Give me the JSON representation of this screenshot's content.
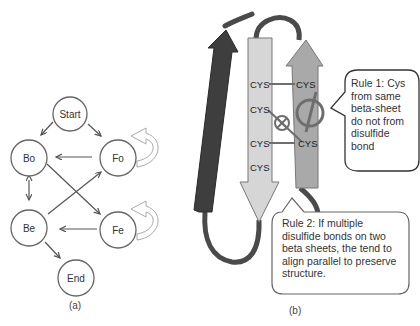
{
  "panel_a": {
    "caption": "(a)",
    "nodes": [
      {
        "id": "start",
        "label": "Start"
      },
      {
        "id": "bo",
        "label": "Bo"
      },
      {
        "id": "fo",
        "label": "Fo"
      },
      {
        "id": "be",
        "label": "Be"
      },
      {
        "id": "fe",
        "label": "Fe"
      },
      {
        "id": "end",
        "label": "End"
      }
    ],
    "edges": [
      {
        "from": "Start",
        "to": "Bo"
      },
      {
        "from": "Start",
        "to": "Fo"
      },
      {
        "from": "Fo",
        "to": "Bo"
      },
      {
        "from": "Fo",
        "to": "Fo",
        "type": "self-loop"
      },
      {
        "from": "Bo",
        "to": "Be",
        "type": "bidirectional"
      },
      {
        "from": "Bo",
        "to": "Fe"
      },
      {
        "from": "Be",
        "to": "Fo"
      },
      {
        "from": "Fe",
        "to": "Be"
      },
      {
        "from": "Fe",
        "to": "Fe",
        "type": "self-loop"
      },
      {
        "from": "Be",
        "to": "End"
      }
    ]
  },
  "panel_b": {
    "caption": "(b)",
    "left_strand_labels": [
      "CYS",
      "CYS",
      "CYS",
      "CYS"
    ],
    "right_strand_labels": [
      "CYS",
      "CYS"
    ],
    "callout_1": "Rule 1: Cys from same beta-sheet do not from disulfide bond",
    "callout_2": "Rule 2: If multiple disulfide bonds on two beta sheets, the tend to align parallel to preserve structure.",
    "colors": {
      "dark_strand": "#3e3e3e",
      "light_strand": "#d6d6d6",
      "mid_strand": "#a9a9a9",
      "loop": "#4a4a4a",
      "bond": "#6e6e6e"
    }
  }
}
